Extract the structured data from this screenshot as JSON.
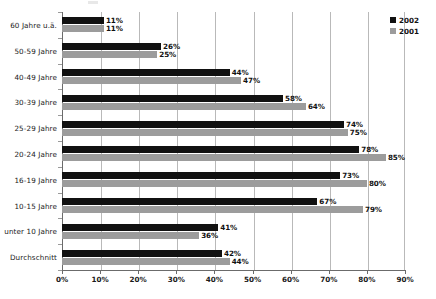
{
  "chart_data": {
    "type": "bar",
    "orientation": "horizontal",
    "title": "",
    "subtitle": "",
    "xlabel": "",
    "ylabel": "",
    "xlim": [
      0,
      90
    ],
    "xticks": [
      0,
      10,
      20,
      30,
      40,
      50,
      60,
      70,
      80,
      90
    ],
    "xtick_labels": [
      "0%",
      "10%",
      "20%",
      "30%",
      "40%",
      "50%",
      "60%",
      "70%",
      "80%",
      "90%"
    ],
    "grid": "vertical",
    "value_suffix": "%",
    "legend_position": "top-right",
    "categories": [
      "60 Jahre u.ä.",
      "50-59 Jahre",
      "40-49 Jahre",
      "30-39 Jahre",
      "25-29 Jahre",
      "20-24 Jahre",
      "16-19 Jahre",
      "10-15 Jahre",
      "unter 10 Jahre",
      "Durchschnitt"
    ],
    "series": [
      {
        "name": "2002",
        "color": "#111111",
        "values": [
          11,
          26,
          44,
          58,
          74,
          78,
          73,
          67,
          41,
          42
        ],
        "labels": [
          "11%",
          "26%",
          "44%",
          "58%",
          "74%",
          "78%",
          "73%",
          "67%",
          "41%",
          "42%"
        ]
      },
      {
        "name": "2001",
        "color": "#9c9c9c",
        "values": [
          11,
          25,
          47,
          64,
          75,
          85,
          80,
          79,
          36,
          44
        ],
        "labels": [
          "11%",
          "25%",
          "47%",
          "64%",
          "75%",
          "85%",
          "80%",
          "79%",
          "36%",
          "44%"
        ]
      }
    ]
  },
  "legend": {
    "entries": [
      {
        "label": "2002",
        "color": "#111111"
      },
      {
        "label": "2001",
        "color": "#9c9c9c"
      }
    ]
  }
}
